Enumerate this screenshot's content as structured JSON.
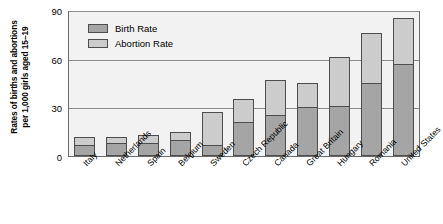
{
  "chart_data": {
    "type": "bar",
    "stacked": true,
    "title": "",
    "xlabel": "",
    "ylabel": "Rates of births and abortions per 1,000 girls aged 15–19",
    "ylabel_lines": [
      "Rates of births and abortions",
      "per 1,000 girls aged 15–19"
    ],
    "ylim": [
      0,
      90
    ],
    "yticks": [
      0,
      30,
      60,
      90
    ],
    "ytick_labels": [
      "0",
      "30",
      "60",
      "90"
    ],
    "grid": true,
    "legend_position": "top-left",
    "categories": [
      "Italy",
      "Netherlands",
      "Spain",
      "Belgium",
      "Sweden",
      "Czech Republic",
      "Canada",
      "Great Britain",
      "Hungary",
      "Romania",
      "United States"
    ],
    "series": [
      {
        "name": "Birth Rate",
        "color": "#a5a5a5",
        "values": [
          7,
          8,
          8,
          10,
          7,
          21,
          25,
          30,
          31,
          45,
          57
        ]
      },
      {
        "name": "Abortion Rate",
        "color": "#cccccc",
        "values": [
          5,
          4,
          5,
          5,
          20,
          14,
          22,
          15,
          30,
          31,
          28
        ]
      }
    ],
    "totals": [
      12,
      12,
      13,
      15,
      27,
      35,
      47,
      45,
      61,
      76,
      85
    ]
  },
  "legend": {
    "items": [
      {
        "label": "Birth Rate",
        "color": "#a5a5a5"
      },
      {
        "label": "Abortion Rate",
        "color": "#cccccc"
      }
    ]
  },
  "colors": {
    "birth_rate": "#a5a5a5",
    "abortion_rate": "#cccccc",
    "plot_background": "#f2f2f2",
    "gridline": "#8c8c8c",
    "axis": "#6b6b6b",
    "bar_border": "#4d4d4d",
    "text": "#000000",
    "page_background": "#ffffff"
  }
}
